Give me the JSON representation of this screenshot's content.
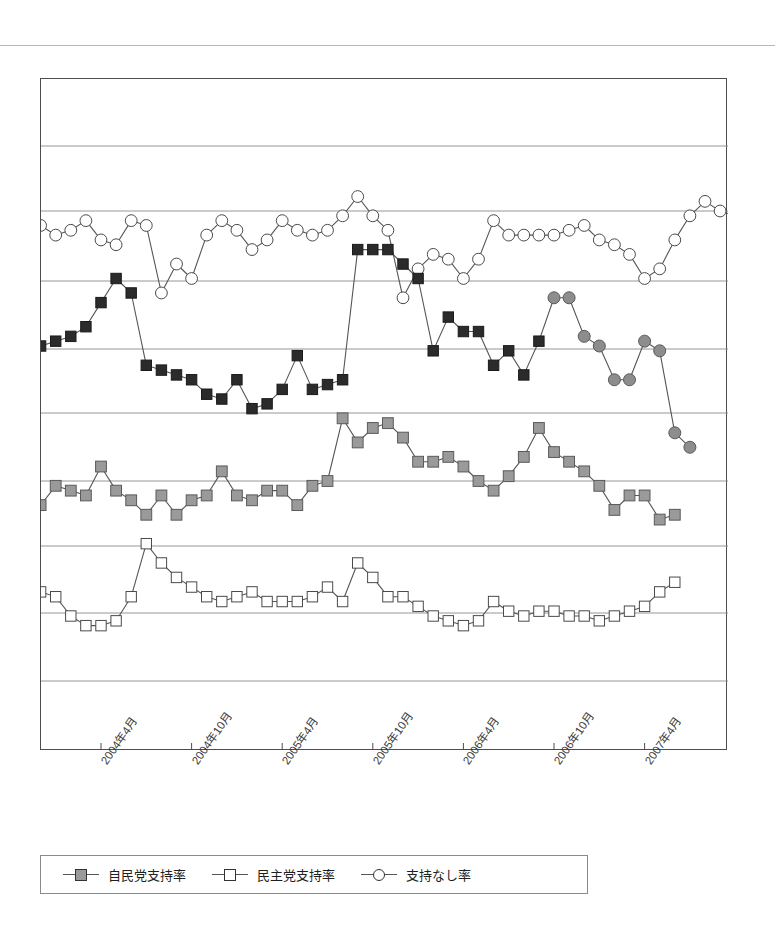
{
  "chart_data": {
    "type": "line",
    "title": "",
    "subtitle": "",
    "xlabel": "",
    "ylabel": "",
    "grid": true,
    "gridlines_y": [
      75,
      145,
      210,
      280,
      348,
      412,
      480,
      545,
      612,
      680,
      750
    ],
    "ylim": [
      0,
      70
    ],
    "yticks": [
      0,
      7,
      14,
      21,
      28,
      35,
      42,
      49,
      56,
      63,
      70
    ],
    "ytick_labels": [],
    "legend_position": "bottom-left",
    "x_axis": {
      "type": "monthly",
      "start": "2003-11",
      "end": "2007-07",
      "tick_labels": [
        "2004年4月",
        "2004年10月",
        "2005年4月",
        "2005年10月",
        "2006年4月",
        "2006年10月",
        "2007年4月"
      ],
      "tick_index": [
        5,
        11,
        17,
        23,
        29,
        35,
        41
      ]
    },
    "series": [
      {
        "name": "内閣支持率",
        "marker": "filled-square-dark",
        "color": "#2b2b2b",
        "legend_shown": false,
        "start_index": 0,
        "values": [
          41.5,
          42.0,
          42.5,
          43.0,
          44.0,
          46.5,
          49.0,
          47.5,
          40.0,
          39.5,
          39.0,
          38.5,
          37.0,
          36.5,
          38.5,
          35.5,
          36.0,
          37.5,
          41.0,
          37.5,
          38.0,
          38.5,
          52.0,
          52.0,
          52.0,
          50.5,
          49.0,
          41.5,
          45.0,
          43.5,
          43.5,
          40.0,
          41.5,
          39.0,
          42.5
        ]
      },
      {
        "name": "内閣支持率(続き)",
        "marker": "filled-circle-gray",
        "color": "#8d8d8d",
        "legend_shown": false,
        "start_index": 35,
        "values": [
          47.0,
          47.0,
          43.0,
          42.0,
          38.5,
          38.5,
          42.5,
          41.5,
          33.0,
          31.5
        ]
      },
      {
        "name": "自民党支持率",
        "marker": "filled-square-gray",
        "color": "#9a9a9a",
        "legend_shown": true,
        "start_index": 0,
        "values": [
          27.0,
          25.5,
          27.5,
          27.0,
          26.5,
          29.5,
          27.0,
          26.0,
          24.5,
          26.5,
          24.5,
          26.0,
          26.5,
          29.0,
          26.5,
          26.0,
          27.0,
          27.0,
          25.5,
          27.5,
          28.0,
          34.5,
          32.0,
          33.5,
          34.0,
          32.5,
          30.0,
          30.0,
          30.5,
          29.5,
          28.0,
          27.0,
          28.5,
          30.5,
          33.5,
          31.0,
          30.0,
          29.0,
          27.5,
          25.0,
          26.5,
          26.5,
          24.0,
          24.5
        ]
      },
      {
        "name": "民主党支持率",
        "marker": "open-square",
        "color": "#ffffff",
        "legend_shown": true,
        "start_index": 0,
        "values": [
          17.5,
          16.5,
          16.0,
          14.0,
          13.0,
          13.0,
          13.5,
          16.0,
          21.5,
          19.5,
          18.0,
          17.0,
          16.0,
          15.5,
          16.0,
          16.5,
          15.5,
          15.5,
          15.5,
          16.0,
          17.0,
          15.5,
          19.5,
          18.0,
          16.0,
          16.0,
          15.0,
          14.0,
          13.5,
          13.0,
          13.5,
          15.5,
          14.5,
          14.0,
          14.5,
          14.5,
          14.0,
          14.0,
          13.5,
          14.0,
          14.5,
          15.0,
          16.5,
          17.5
        ]
      },
      {
        "name": "支持なし率",
        "marker": "open-circle",
        "color": "#ffffff",
        "legend_shown": true,
        "start_index": 0,
        "values": [
          50.5,
          54.5,
          53.5,
          54.0,
          55.0,
          53.0,
          52.5,
          55.0,
          54.5,
          47.5,
          50.5,
          49.0,
          53.5,
          55.0,
          54.0,
          52.0,
          53.0,
          55.0,
          54.0,
          53.5,
          54.0,
          55.5,
          57.5,
          55.5,
          54.0,
          47.0,
          50.0,
          51.5,
          51.0,
          49.0,
          51.0,
          55.0,
          53.5,
          53.5,
          53.5,
          53.5,
          54.0,
          54.5,
          53.0,
          52.5,
          51.5,
          49.0,
          50.0,
          53.0,
          55.5,
          57.0,
          56.0,
          55.5,
          54.5,
          57.0,
          55.0
        ]
      }
    ]
  },
  "legend": {
    "items": [
      {
        "label": "自民党支持率",
        "marker": "sq-filled"
      },
      {
        "label": "民主党支持率",
        "marker": "sq-open"
      },
      {
        "label": "支持なし率",
        "marker": "ci-open"
      }
    ]
  },
  "colors": {
    "frame": "#4d4d4d",
    "gridline": "#8a8a8a",
    "dark_marker": "#2b2b2b",
    "gray_marker": "#9a9a9a",
    "gray_circle": "#8d8d8d",
    "open_marker": "#ffffff",
    "line": "#555555",
    "page_rule": "#b8b8b8"
  }
}
